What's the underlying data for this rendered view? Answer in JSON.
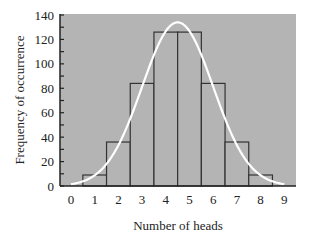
{
  "chart_data": {
    "type": "bar",
    "title": "",
    "xlabel": "Number of heads",
    "ylabel": "Frequency of occurrence",
    "x_ticks": [
      0,
      1,
      2,
      3,
      4,
      5,
      6,
      7,
      8,
      9
    ],
    "y_ticks": [
      0,
      20,
      40,
      60,
      80,
      100,
      120,
      140
    ],
    "xlim": [
      -0.5,
      9.5
    ],
    "ylim": [
      0,
      140
    ],
    "grid": false,
    "legend": null,
    "categories": [
      1,
      2,
      3,
      4,
      5,
      6,
      7,
      8
    ],
    "values": [
      9,
      36,
      84,
      126,
      126,
      84,
      36,
      9
    ],
    "overlay": {
      "type": "line",
      "name": "normal approximation curve",
      "description": "white bell-shaped curve centered at 4.5, peak ~134",
      "mean": 4.5,
      "peak": 134,
      "sd": 1.5
    },
    "colors": {
      "plot_background": "#b4b4b4",
      "bar_fill": "#b4b4b4",
      "bar_edge": "#333333",
      "curve": "#ffffff",
      "axis": "#222222"
    }
  }
}
